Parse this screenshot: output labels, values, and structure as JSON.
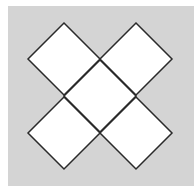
{
  "diagram": {
    "colors": {
      "page_background": "#ffffff",
      "panel_background": "#d4d4d4",
      "diamond_fill": "#ffffff",
      "diamond_stroke": "#2a2a2a"
    },
    "panel": {
      "x": 8,
      "y": 6,
      "width": 186,
      "height": 180
    },
    "diamond_half_diagonal": 36,
    "diamonds": [
      {
        "id": "top-left",
        "cx": 64,
        "cy": 59
      },
      {
        "id": "top-right",
        "cx": 136,
        "cy": 59
      },
      {
        "id": "center",
        "cx": 100,
        "cy": 96
      },
      {
        "id": "bottom-left",
        "cx": 64,
        "cy": 133
      },
      {
        "id": "bottom-right",
        "cx": 136,
        "cy": 133
      }
    ]
  }
}
